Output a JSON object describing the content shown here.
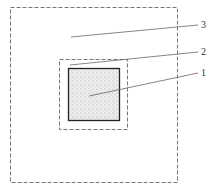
{
  "diagram": {
    "labels": [
      {
        "id": "1",
        "text": "1",
        "x": 202,
        "y": 68
      },
      {
        "id": "2",
        "text": "2",
        "x": 202,
        "y": 47
      },
      {
        "id": "3",
        "text": "3",
        "x": 202,
        "y": 20
      }
    ],
    "colors": {
      "line": "#555555",
      "fill": "#e4e4e4",
      "solid": "#222222"
    }
  }
}
